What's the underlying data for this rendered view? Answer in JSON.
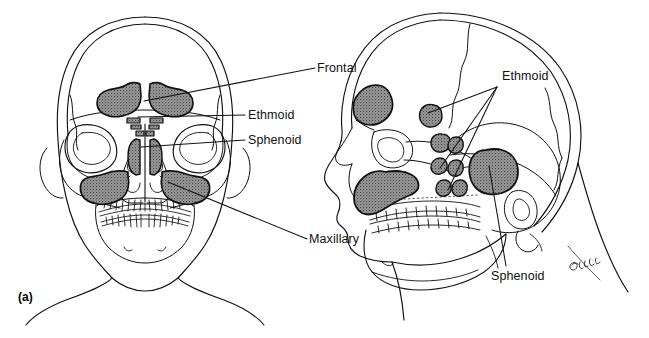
{
  "figure": {
    "panel_letter": "(a)",
    "background_color": "#ffffff",
    "line_color": "#111111",
    "sinus_fill_color": "#8a8a8a",
    "sinus_outline_color": "#111111",
    "width": 649,
    "height": 338
  },
  "views": {
    "frontal": {
      "name": "anterior skull view",
      "labels": [
        {
          "id": "frontal",
          "text": "Frontal",
          "x": 317,
          "y": 61,
          "leader_from": [
            315,
            68
          ],
          "leader_to": [
            144,
            101
          ]
        },
        {
          "id": "ethmoid",
          "text": "Ethmoid",
          "x": 248,
          "y": 108,
          "leader_from": [
            245,
            115
          ],
          "leader_to": [
            138,
            117
          ]
        },
        {
          "id": "sphenoid",
          "text": "Sphenoid",
          "x": 248,
          "y": 133,
          "leader_from": [
            245,
            140
          ],
          "leader_to": [
            141,
            146
          ]
        },
        {
          "id": "maxillary",
          "text": "Maxillary",
          "x": 309,
          "y": 232,
          "leader_from": [
            307,
            239
          ],
          "leader_to": [
            168,
            181
          ]
        }
      ]
    },
    "lateral": {
      "name": "lateral skull view",
      "labels": [
        {
          "id": "ethmoid",
          "text": "Ethmoid",
          "x": 502,
          "y": 69,
          "leader_hub": [
            497,
            87
          ]
        },
        {
          "id": "sphenoid",
          "text": "Sphenoid",
          "x": 491,
          "y": 269,
          "leader_from": [
            506,
            267
          ],
          "leader_to": [
            489,
            163
          ]
        }
      ],
      "artist_signature": "Gatto"
    }
  },
  "sinuses": [
    {
      "name": "frontal sinus",
      "view": "frontal",
      "count": 2
    },
    {
      "name": "ethmoid sinus",
      "view": "frontal",
      "count": 2
    },
    {
      "name": "sphenoid sinus",
      "view": "frontal",
      "count": 2
    },
    {
      "name": "maxillary sinus",
      "view": "frontal",
      "count": 2
    },
    {
      "name": "frontal sinus",
      "view": "lateral",
      "count": 1
    },
    {
      "name": "ethmoid sinus",
      "view": "lateral",
      "count": 7
    },
    {
      "name": "sphenoid sinus",
      "view": "lateral",
      "count": 1
    },
    {
      "name": "maxillary sinus",
      "view": "lateral",
      "count": 1
    }
  ]
}
